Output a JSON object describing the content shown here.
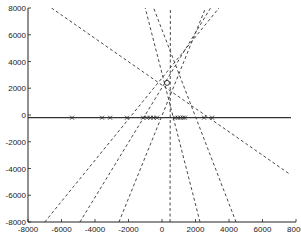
{
  "chart_data": {
    "type": "line",
    "title": "",
    "xlabel": "",
    "ylabel": "",
    "xlim": [
      -8000,
      8000
    ],
    "ylim": [
      -8000,
      8000
    ],
    "grid": false,
    "legend": null,
    "x_ticks": [
      -8000,
      -6000,
      -4000,
      -2000,
      0,
      2000,
      4000,
      6000,
      8000
    ],
    "y_ticks": [
      -8000,
      -6000,
      -4000,
      -2000,
      0,
      2000,
      4000,
      6000,
      8000
    ],
    "x_tick_labels": [
      "-8000",
      "-6000",
      "-4000",
      "-2000",
      "0",
      "2000",
      "4000",
      "6000",
      "8000"
    ],
    "y_tick_labels": [
      "-8000",
      "-6000",
      "-4000",
      "-2000",
      "0",
      "2000",
      "4000",
      "6000",
      "8000"
    ],
    "horizontal_line": {
      "y": -200,
      "x_range": [
        -8000,
        7700
      ],
      "style": "solid"
    },
    "markers": {
      "symbol": "x",
      "y": -200,
      "x": [
        -5370,
        -3580,
        -3100,
        -2090,
        -1130,
        -900,
        -700,
        -500,
        -300,
        780,
        950,
        1100,
        1250,
        1370,
        2510,
        2990
      ]
    },
    "convergence_point": {
      "x": 300,
      "y": 2400,
      "marker": "o"
    },
    "series": [
      {
        "name": "dashed-1",
        "style": "dashed",
        "points": [
          [
            -6600,
            8000
          ],
          [
            7600,
            -4400
          ]
        ]
      },
      {
        "name": "dashed-2",
        "style": "dashed",
        "points": [
          [
            -7000,
            -8000
          ],
          [
            3400,
            8000
          ]
        ]
      },
      {
        "name": "dashed-3",
        "style": "dashed",
        "points": [
          [
            -4900,
            -8000
          ],
          [
            2900,
            8000
          ]
        ]
      },
      {
        "name": "dashed-4",
        "style": "dashed",
        "points": [
          [
            -2570,
            -8000
          ],
          [
            2600,
            8000
          ]
        ]
      },
      {
        "name": "dashed-5",
        "style": "dashed",
        "points": [
          [
            480,
            -8000
          ],
          [
            500,
            8000
          ]
        ]
      },
      {
        "name": "dashed-6",
        "style": "dashed",
        "points": [
          [
            2270,
            -8000
          ],
          [
            -1000,
            8000
          ]
        ]
      },
      {
        "name": "dashed-7",
        "style": "dashed",
        "points": [
          [
            4420,
            -8000
          ],
          [
            -500,
            8000
          ]
        ]
      }
    ]
  }
}
